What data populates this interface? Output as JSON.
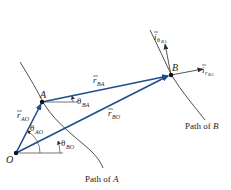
{
  "colors": {
    "vector": "#1f4e8c",
    "ink": "#1a1a1a"
  },
  "points": {
    "O": "O",
    "A": "A",
    "B": "B"
  },
  "vectors": {
    "r_AO": {
      "symbol": "r",
      "sub": "AO"
    },
    "r_BA": {
      "symbol": "r",
      "sub": "BA"
    },
    "r_BO": {
      "symbol": "r",
      "sub": "BO"
    }
  },
  "angles": {
    "theta_AO": {
      "symbol": "θ",
      "sub": "AO"
    },
    "theta_BO": {
      "symbol": "θ",
      "sub": "BO"
    },
    "theta_BA": {
      "symbol": "θ",
      "sub": "BA"
    }
  },
  "unit_vectors": {
    "i_theta_BA": {
      "symbol": "i",
      "sub": "θ",
      "subsub": "BA"
    },
    "i_r_BA": {
      "symbol": "i",
      "sub": "r",
      "subsub": "BA"
    }
  },
  "paths": {
    "path_A": {
      "text": "Path of ",
      "name": "A"
    },
    "path_B": {
      "text": "Path of ",
      "name": "B"
    }
  }
}
